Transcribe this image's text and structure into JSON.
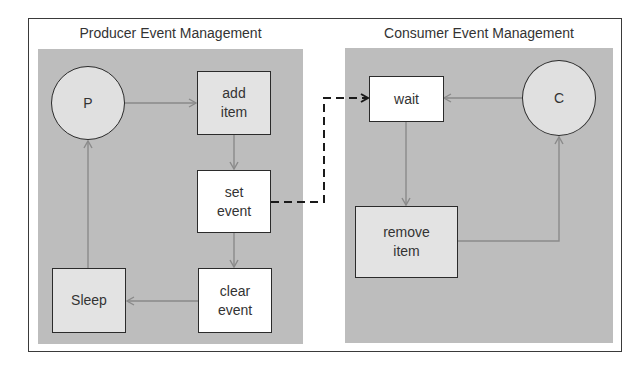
{
  "producer": {
    "title": "Producer Event Management",
    "nodes": {
      "p": "P",
      "add_item": "add\nitem",
      "set_event": "set\nevent",
      "clear_event": "clear\nevent",
      "sleep": "Sleep"
    }
  },
  "consumer": {
    "title": "Consumer Event Management",
    "nodes": {
      "c": "C",
      "wait": "wait",
      "remove_item": "remove\nitem"
    }
  },
  "edges": [
    {
      "from": "P",
      "to": "add item",
      "style": "solid"
    },
    {
      "from": "add item",
      "to": "set event",
      "style": "solid"
    },
    {
      "from": "set event",
      "to": "clear event",
      "style": "solid"
    },
    {
      "from": "clear event",
      "to": "Sleep",
      "style": "solid"
    },
    {
      "from": "Sleep",
      "to": "P",
      "style": "solid"
    },
    {
      "from": "set event",
      "to": "wait",
      "style": "dashed"
    },
    {
      "from": "C",
      "to": "wait",
      "style": "solid"
    },
    {
      "from": "wait",
      "to": "remove item",
      "style": "solid"
    },
    {
      "from": "remove item",
      "to": "C",
      "style": "solid"
    }
  ],
  "colors": {
    "panel": "#bdbdbd",
    "border": "#2b2b2b",
    "arrow": "#8a8a8a",
    "dashed": "#1a1a1a"
  }
}
